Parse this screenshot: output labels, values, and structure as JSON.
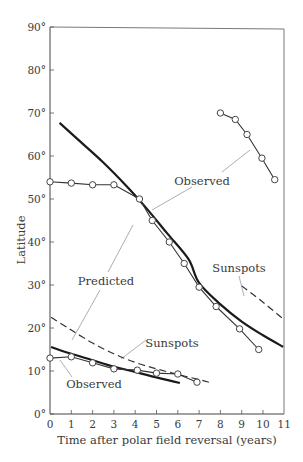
{
  "chart_data": {
    "type": "line",
    "title": "",
    "xlabel": "Time after polar field reversal (years)",
    "ylabel": "Latitude",
    "xlim": [
      0,
      11
    ],
    "ylim": [
      0,
      90
    ],
    "x_ticks": [
      "0",
      "1",
      "2",
      "3",
      "4",
      "5",
      "6",
      "7",
      "8",
      "9",
      "10",
      "11"
    ],
    "y_ticks": [
      "0°",
      "10°",
      "20°",
      "30°",
      "40°",
      "50°",
      "60°",
      "70°",
      "80°",
      "90°"
    ],
    "grid": false,
    "legend": "none (inline annotations)",
    "series": [
      {
        "name": "Predicted (high-latitude branch)",
        "style": "solid-thick",
        "points": [
          [
            0.45,
            67.7
          ],
          [
            1.5,
            63
          ],
          [
            2.5,
            58.5
          ],
          [
            3.5,
            53.5
          ],
          [
            4.5,
            48
          ],
          [
            5.5,
            42
          ],
          [
            6.5,
            36
          ],
          [
            7.0,
            30.5
          ],
          [
            8.0,
            25.5
          ],
          [
            9.0,
            21.5
          ],
          [
            10.0,
            18.3
          ],
          [
            10.95,
            15.6
          ]
        ]
      },
      {
        "name": "Observed (high-latitude, early cycle)",
        "style": "line-with-open-circles",
        "points": [
          [
            0,
            54
          ],
          [
            1,
            53.7
          ],
          [
            2,
            53.3
          ],
          [
            3,
            53.3
          ],
          [
            4.2,
            50
          ],
          [
            4.8,
            45
          ],
          [
            5.6,
            40
          ],
          [
            6.3,
            35
          ],
          [
            7.0,
            29.5
          ],
          [
            7.8,
            25
          ],
          [
            8.9,
            19.8
          ],
          [
            9.8,
            15
          ]
        ]
      },
      {
        "name": "Observed (polar, late cycle)",
        "style": "line-with-open-circles",
        "points": [
          [
            8.0,
            70
          ],
          [
            8.7,
            68.5
          ],
          [
            9.25,
            65
          ],
          [
            9.95,
            59.5
          ],
          [
            10.55,
            54.5
          ]
        ]
      },
      {
        "name": "Sunspots (upper, next cycle)",
        "style": "dashed",
        "points": [
          [
            9.0,
            29.8
          ],
          [
            10.0,
            26
          ],
          [
            10.9,
            22.3
          ]
        ]
      },
      {
        "name": "Sunspots (lower)",
        "style": "dashed",
        "points": [
          [
            0.05,
            22.5
          ],
          [
            1,
            19.5
          ],
          [
            2,
            16.5
          ],
          [
            3,
            14
          ],
          [
            4,
            12
          ],
          [
            5,
            10.5
          ],
          [
            6,
            9.2
          ],
          [
            7,
            8
          ],
          [
            7.6,
            7.2
          ]
        ]
      },
      {
        "name": "Predicted (low-latitude branch)",
        "style": "solid-thick",
        "points": [
          [
            0.05,
            15.6
          ],
          [
            1,
            14
          ],
          [
            2,
            12.5
          ],
          [
            3,
            11
          ],
          [
            4,
            9.8
          ],
          [
            5,
            8.5
          ],
          [
            6.1,
            7.2
          ]
        ]
      },
      {
        "name": "Observed (low-latitude)",
        "style": "line-with-open-circles",
        "points": [
          [
            0,
            13
          ],
          [
            1,
            13.3
          ],
          [
            2,
            11.9
          ],
          [
            3,
            10.5
          ],
          [
            4.1,
            10.2
          ],
          [
            5.0,
            9.5
          ],
          [
            6.0,
            9.3
          ],
          [
            6.9,
            7.4
          ]
        ]
      }
    ],
    "annotations": [
      {
        "text": "Observed",
        "x": 7.2,
        "y": 54.3
      },
      {
        "text": "Predicted",
        "x": 2.6,
        "y": 30.8
      },
      {
        "text": "Sunspots",
        "x": 8.0,
        "y": 33.2
      },
      {
        "text": "Sunspots",
        "x": 5.7,
        "y": 16.5
      },
      {
        "text": "Observed",
        "x": 2.0,
        "y": 7
      }
    ]
  },
  "labels": {
    "xlabel": "Time after polar field reversal (years)",
    "ylabel": "Latitude",
    "annot_observed_upper": "Observed",
    "annot_predicted": "Predicted",
    "annot_sunspots_upper": "Sunspots",
    "annot_sunspots_lower": "Sunspots",
    "annot_observed_lower": "Observed"
  }
}
